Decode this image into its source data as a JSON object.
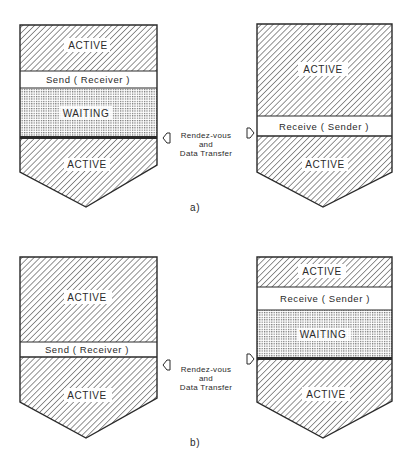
{
  "figure": {
    "panels": [
      {
        "id": "a",
        "caption": "a)",
        "left_process": {
          "segments": [
            {
              "kind": "active",
              "label": "ACTIVE"
            },
            {
              "kind": "call",
              "label": "Send ( Receiver )"
            },
            {
              "kind": "waiting",
              "label": "WAITING"
            },
            {
              "kind": "active",
              "label": "ACTIVE"
            }
          ]
        },
        "right_process": {
          "segments": [
            {
              "kind": "active",
              "label": "ACTIVE"
            },
            {
              "kind": "call",
              "label": "Receive ( Sender )"
            },
            {
              "kind": "active",
              "label": "ACTIVE"
            }
          ]
        },
        "sync_note": [
          "Rendez-vous",
          "and",
          "Data Transfer"
        ]
      },
      {
        "id": "b",
        "caption": "b)",
        "left_process": {
          "segments": [
            {
              "kind": "active",
              "label": "ACTIVE"
            },
            {
              "kind": "call",
              "label": "Send ( Receiver )"
            },
            {
              "kind": "active",
              "label": "ACTIVE"
            }
          ]
        },
        "right_process": {
          "segments": [
            {
              "kind": "active",
              "label": "ACTIVE"
            },
            {
              "kind": "call",
              "label": "Receive ( Sender )"
            },
            {
              "kind": "waiting",
              "label": "WAITING"
            },
            {
              "kind": "active",
              "label": "ACTIVE"
            }
          ]
        },
        "sync_note": [
          "Rendez-vous",
          "and",
          "Data Transfer"
        ]
      }
    ],
    "colors": {
      "ink": "#2a2a2a",
      "background": "#ffffff",
      "hatch": "#3a3a3a",
      "dots": "#555555"
    }
  }
}
